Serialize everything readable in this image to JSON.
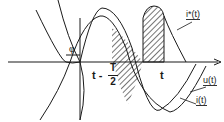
{
  "diagram": {
    "type": "waveform",
    "axis": {
      "label": ""
    },
    "labels": {
      "phi": "φ",
      "t_minus_prefix": "t -",
      "frac_num": "T",
      "frac_den": "2",
      "t": "t",
      "i_star": "i*(t)",
      "u": "u(t)",
      "i": "i(t)"
    },
    "colors": {
      "stroke": "#1a1a1a",
      "background": "#ffffff"
    }
  }
}
